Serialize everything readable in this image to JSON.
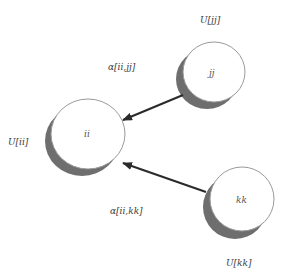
{
  "diagram": {
    "nodes": [
      {
        "id": "ii",
        "label": "ii",
        "utility_label": "U[ii]"
      },
      {
        "id": "jj",
        "label": "jj",
        "utility_label": "U[jj]"
      },
      {
        "id": "kk",
        "label": "kk",
        "utility_label": "U[kk]"
      }
    ],
    "edges": [
      {
        "from": "jj",
        "to": "ii",
        "label": "α[ii,jj]"
      },
      {
        "from": "kk",
        "to": "ii",
        "label": "α[ii,kk]"
      }
    ],
    "colors": {
      "circle_fill": "#ffffff",
      "circle_stroke": "#9a9a9a",
      "shadow": "#6e6e6e",
      "arrow": "#2a2a2a"
    }
  }
}
